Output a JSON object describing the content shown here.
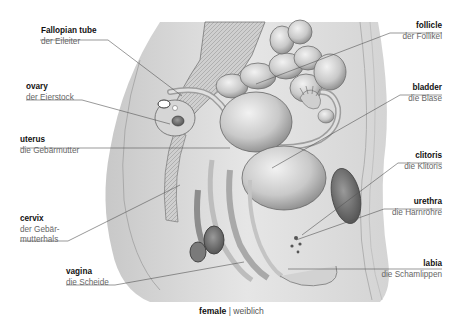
{
  "labels": {
    "fallopian_tube": {
      "en": "Fallopian tube",
      "de": "der Eileiter"
    },
    "ovary": {
      "en": "ovary",
      "de": "der Eierstock"
    },
    "uterus": {
      "en": "uterus",
      "de": "die Gebärmutter"
    },
    "cervix": {
      "en": "cervix",
      "de1": "der Gebär-",
      "de2": "mutterhals"
    },
    "vagina": {
      "en": "vagina",
      "de": "die Scheide"
    },
    "follicle": {
      "en": "follicle",
      "de": "der Follikel"
    },
    "bladder": {
      "en": "bladder",
      "de": "die Blase"
    },
    "clitoris": {
      "en": "clitoris",
      "de": "die Klitoris"
    },
    "urethra": {
      "en": "urethra",
      "de": "die Harnröhre"
    },
    "labia": {
      "en": "labia",
      "de": "die Schamlippen"
    }
  },
  "caption": {
    "en": "female",
    "separator": " | ",
    "de": "weiblich"
  }
}
